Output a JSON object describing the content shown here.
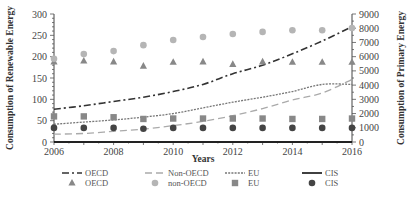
{
  "chart_data": {
    "type": "line",
    "title": "",
    "xlabel": "Years",
    "ylabel": "Consumption of Renewable Energy",
    "y2label": "Consumption of Primary Energy",
    "xlim": [
      2006,
      2016
    ],
    "ylim": [
      0,
      300
    ],
    "y2lim": [
      0,
      9000
    ],
    "xticks": [
      "2006",
      "2008",
      "2010",
      "2012",
      "2014",
      "2016"
    ],
    "yticks": [
      "0",
      "50",
      "100",
      "150",
      "200",
      "250",
      "300"
    ],
    "y2ticks": [
      "0",
      "1000",
      "2000",
      "3000",
      "4000",
      "5000",
      "6000",
      "7000",
      "8000",
      "9000"
    ],
    "x": [
      2006,
      2007,
      2008,
      2009,
      2010,
      2011,
      2012,
      2013,
      2014,
      2015,
      2016
    ],
    "lines": [
      {
        "name": "OECD",
        "axis": "right",
        "style": "dash-dot",
        "color": "#333333",
        "values": [
          2300,
          2550,
          2850,
          3150,
          3550,
          4050,
          4800,
          5400,
          6200,
          7100,
          8100
        ]
      },
      {
        "name": "Non-OECD",
        "axis": "right",
        "style": "dashed",
        "color": "#aaaaaa",
        "values": [
          550,
          600,
          750,
          900,
          1150,
          1450,
          1850,
          2350,
          2950,
          3450,
          4400
        ]
      },
      {
        "name": "EU",
        "axis": "right",
        "style": "dotted",
        "color": "#777777",
        "values": [
          1250,
          1400,
          1550,
          1750,
          2000,
          2400,
          2800,
          3150,
          3550,
          4050,
          4050
        ]
      },
      {
        "name": "CIS",
        "axis": "right",
        "style": "solid",
        "color": "#111111",
        "values": [
          0,
          0,
          0,
          0,
          0,
          0,
          0,
          0,
          0,
          0,
          0
        ]
      }
    ],
    "scatter": [
      {
        "name": "OECD",
        "axis": "left",
        "marker": "triangle",
        "color": "#888888",
        "values": [
          188,
          190,
          188,
          178,
          187,
          188,
          182,
          188,
          187,
          187,
          187
        ]
      },
      {
        "name": "non-OECD",
        "axis": "left",
        "marker": "circle",
        "color": "#b5b5b5",
        "values": [
          195,
          206,
          213,
          227,
          239,
          246,
          253,
          258,
          262,
          262,
          267
        ]
      },
      {
        "name": "EU",
        "axis": "left",
        "marker": "square",
        "color": "#888888",
        "values": [
          60,
          60,
          58,
          54,
          55,
          55,
          55,
          55,
          54,
          54,
          55
        ]
      },
      {
        "name": "CIS",
        "axis": "left",
        "marker": "circle",
        "color": "#444444",
        "values": [
          33,
          33,
          33,
          31,
          33,
          33,
          33,
          33,
          33,
          33,
          33
        ]
      }
    ],
    "legend": {
      "position": "bottom",
      "rows": [
        [
          {
            "label": "OECD",
            "kind": "line",
            "ref": "OECD"
          },
          {
            "label": "Non-OECD",
            "kind": "line",
            "ref": "Non-OECD"
          },
          {
            "label": "EU",
            "kind": "line",
            "ref": "EU"
          },
          {
            "label": "CIS",
            "kind": "line",
            "ref": "CIS"
          }
        ],
        [
          {
            "label": "OECD",
            "kind": "marker",
            "ref": "OECD"
          },
          {
            "label": "non-OECD",
            "kind": "marker",
            "ref": "non-OECD"
          },
          {
            "label": "EU",
            "kind": "marker",
            "ref": "EU"
          },
          {
            "label": "CIS",
            "kind": "marker",
            "ref": "CIS"
          }
        ]
      ]
    },
    "grid": false
  }
}
